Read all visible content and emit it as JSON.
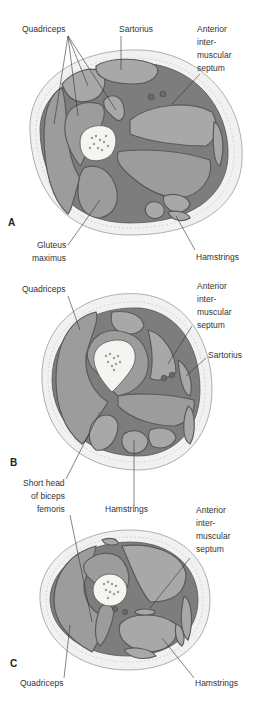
{
  "panels": [
    {
      "letter": "A",
      "labels": {
        "quadriceps": "Quadriceps",
        "sartorius": "Sartorius",
        "septum_l1": "Anterior",
        "septum_l2": "inter-",
        "septum_l3": "muscular",
        "septum_l4": "septum",
        "gluteus_l1": "Gluteus",
        "gluteus_l2": "maximus",
        "hamstrings": "Hamstrings"
      }
    },
    {
      "letter": "B",
      "labels": {
        "quadriceps": "Quadriceps",
        "septum_l1": "Anterior",
        "septum_l2": "inter-",
        "septum_l3": "muscular",
        "septum_l4": "septum",
        "sartorius": "Sartorius",
        "short_head_l1": "Short head",
        "short_head_l2": "of biceps",
        "short_head_l3": "femoris",
        "hamstrings": "Hamstrings"
      }
    },
    {
      "letter": "C",
      "labels": {
        "septum_l1": "Anterior",
        "septum_l2": "inter-",
        "septum_l3": "muscular",
        "septum_l4": "septum",
        "quadriceps": "Quadriceps",
        "hamstrings": "Hamstrings"
      }
    }
  ]
}
